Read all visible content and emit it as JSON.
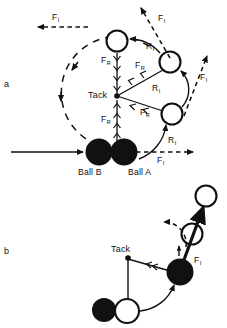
{
  "figure": {
    "title": "",
    "background": "#ffffff",
    "ink": "#000000",
    "width": 227,
    "height": 328
  },
  "panels": [
    {
      "id": "a",
      "letter": "a",
      "x": 4,
      "y": 82
    },
    {
      "id": "b",
      "letter": "b",
      "x": 4,
      "y": 248
    }
  ],
  "labels": {
    "tack_a": "Tack",
    "tack_b": "Tack",
    "ball_b": "Ball B",
    "ball_a": "Ball A"
  },
  "force_labels": [
    {
      "id": "fi-top-left",
      "base": "F",
      "sub": "I",
      "x": 52,
      "y": 18
    },
    {
      "id": "fi-top-right",
      "base": "F",
      "sub": "I",
      "x": 158,
      "y": 19
    },
    {
      "id": "fr-upper-mid",
      "base": "F",
      "sub": "R",
      "x": 108,
      "y": 59
    },
    {
      "id": "fr-upper-right",
      "base": "F",
      "sub": "R",
      "x": 140,
      "y": 64
    },
    {
      "id": "fi-right",
      "base": "F",
      "sub": "I",
      "x": 202,
      "y": 77
    },
    {
      "id": "fr-mid-right",
      "base": "F",
      "sub": "R",
      "x": 146,
      "y": 112
    },
    {
      "id": "fr-lower-mid",
      "base": "F",
      "sub": "R",
      "x": 108,
      "y": 118
    },
    {
      "id": "fi-bottom",
      "base": "F",
      "sub": "I",
      "x": 160,
      "y": 160
    },
    {
      "id": "fi-panel-b",
      "base": "F",
      "sub": "I",
      "x": 196,
      "y": 260
    }
  ],
  "radius_labels": [
    {
      "id": "ri-upper",
      "base": "R",
      "sub": "I",
      "x": 150,
      "y": 46
    },
    {
      "id": "ri-mid",
      "base": "R",
      "sub": "I",
      "x": 156,
      "y": 88
    },
    {
      "id": "ri-lower",
      "base": "R",
      "sub": "I",
      "x": 172,
      "y": 140
    }
  ],
  "geometry": {
    "panel_a": {
      "tack": {
        "x": 117,
        "y": 96
      },
      "balls_solid": [
        {
          "name": "ball-b",
          "cx": 99,
          "cy": 152,
          "r": 13
        },
        {
          "name": "ball-a",
          "cx": 124,
          "cy": 152,
          "r": 13
        }
      ],
      "open_circles": [
        {
          "name": "open-circle-top",
          "cx": 117,
          "cy": 41,
          "r": 11
        },
        {
          "name": "open-circle-upper-right",
          "cx": 170,
          "cy": 62,
          "r": 11
        },
        {
          "name": "open-circle-lower-right",
          "cx": 172,
          "cy": 114,
          "r": 11
        }
      ],
      "incoming_arrow": {
        "x1": 11,
        "y1": 152,
        "x2": 84,
        "y2": 152
      }
    },
    "panel_b": {
      "tack": {
        "x": 128,
        "y": 258
      },
      "solid_balls": [
        {
          "name": "ball-b-start",
          "cx": 104,
          "cy": 310,
          "r": 12
        },
        {
          "name": "ball-a-moved",
          "cx": 180,
          "cy": 272,
          "r": 13
        }
      ],
      "open_circles": [
        {
          "name": "open-start",
          "cx": 127,
          "cy": 312,
          "r": 12
        },
        {
          "name": "open-mid",
          "cx": 192,
          "cy": 234,
          "r": 11
        },
        {
          "name": "open-top",
          "cx": 206,
          "cy": 195,
          "r": 11
        }
      ]
    }
  }
}
